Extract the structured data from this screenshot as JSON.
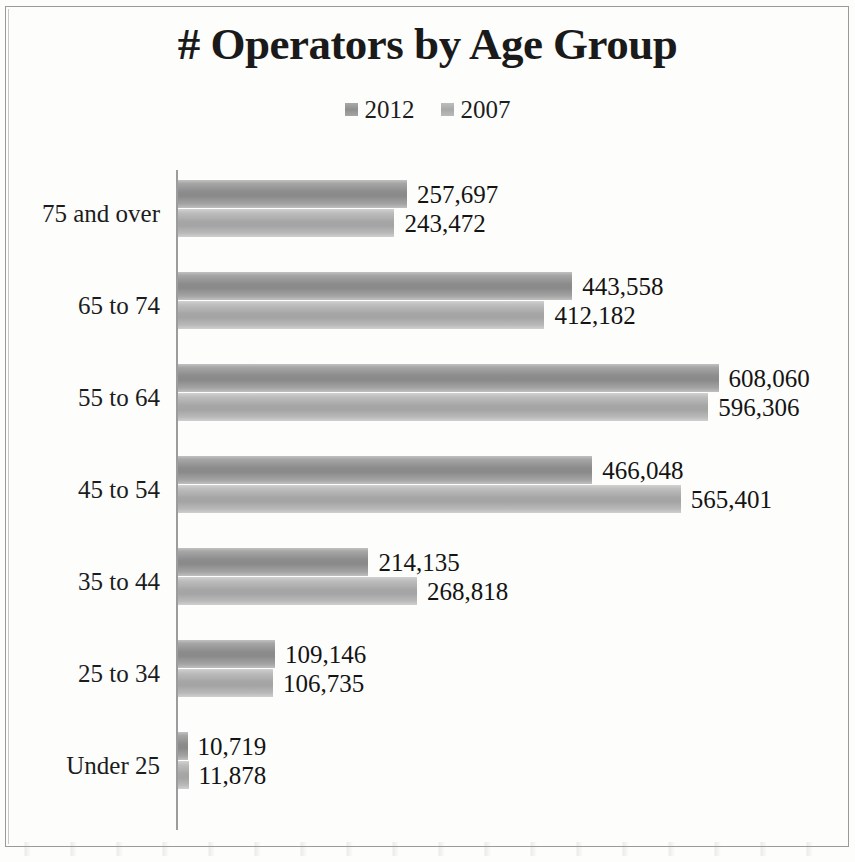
{
  "chart_data": {
    "type": "bar",
    "orientation": "horizontal",
    "title": "# Operators by Age Group",
    "xlabel": "",
    "ylabel": "",
    "grid": false,
    "legend_position": "top-center",
    "axis_max": 640000,
    "categories": [
      "75 and over",
      "65 to 74",
      "55 to 64",
      "45 to 54",
      "35 to 44",
      "25 to 34",
      "Under 25"
    ],
    "series": [
      {
        "name": "2012",
        "color": "#8c8c8c",
        "values": [
          257697,
          443558,
          608060,
          466048,
          214135,
          109146,
          10719
        ],
        "labels": [
          "257,697",
          "443,558",
          "608,060",
          "466,048",
          "214,135",
          "109,146",
          "10,719"
        ]
      },
      {
        "name": "2007",
        "color": "#a6a6a6",
        "values": [
          243472,
          412182,
          596306,
          565401,
          268818,
          106735,
          11878
        ],
        "labels": [
          "243,472",
          "412,182",
          "596,306",
          "565,401",
          "268,818",
          "106,735",
          "11,878"
        ]
      }
    ]
  },
  "legend": {
    "items": [
      {
        "label": "2012",
        "swatch_class": "s2012"
      },
      {
        "label": "2007",
        "swatch_class": "s2007"
      }
    ]
  }
}
